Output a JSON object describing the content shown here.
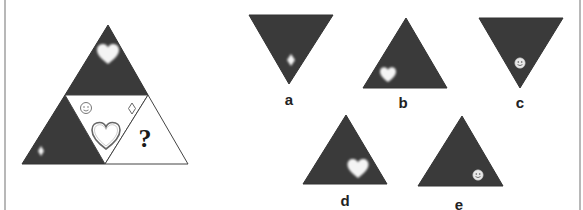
{
  "puzzle": {
    "question_mark": "?",
    "colors": {
      "dark_fill": "#3a3a3a",
      "light_fill": "#ffffff",
      "outline": "#555555",
      "symbol_light": "#f4f4f4",
      "border": "#b8b8b8"
    },
    "main_figure": {
      "segments": [
        {
          "position": "top",
          "fill": "dark",
          "symbol": "heart-icon"
        },
        {
          "position": "bottom-left",
          "fill": "dark",
          "symbol": "diamond-icon"
        },
        {
          "position": "center",
          "fill": "light",
          "symbols": [
            "smiley-icon",
            "diamond-icon",
            "heart-icon"
          ]
        },
        {
          "position": "bottom-right",
          "fill": "light",
          "symbol": "question-mark"
        }
      ]
    },
    "options": [
      {
        "label": "a",
        "orientation": "down",
        "symbol": "diamond-icon"
      },
      {
        "label": "b",
        "orientation": "up",
        "symbol": "heart-icon"
      },
      {
        "label": "c",
        "orientation": "down",
        "symbol": "smiley-icon"
      },
      {
        "label": "d",
        "orientation": "up",
        "symbol": "heart-icon"
      },
      {
        "label": "e",
        "orientation": "up",
        "symbol": "smiley-icon"
      }
    ]
  }
}
